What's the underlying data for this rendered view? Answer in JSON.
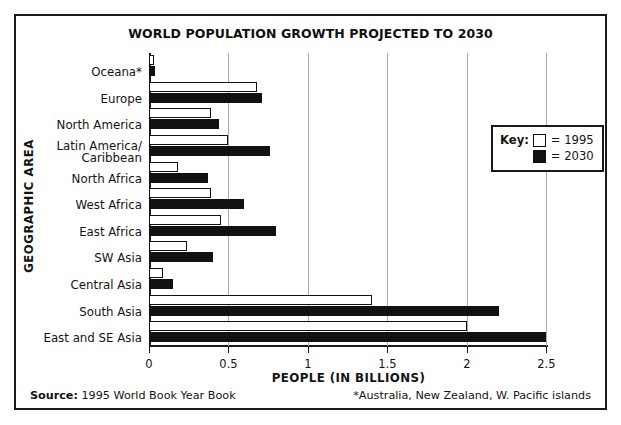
{
  "figure": {
    "title": "WORLD POPULATION GROWTH PROJECTED TO 2030",
    "source_label": "Source:",
    "source_text": " 1995 World Book Year Book",
    "footnote": "*Australia, New Zealand, W. Pacific islands"
  },
  "legend": {
    "key_label": "Key:",
    "entries": [
      {
        "label": "= 1995",
        "style": "open",
        "color": "#ffffff"
      },
      {
        "label": "= 2030",
        "style": "filled",
        "color": "#111111"
      }
    ]
  },
  "chart_data": {
    "type": "bar",
    "orientation": "horizontal",
    "title": "WORLD POPULATION GROWTH PROJECTED TO 2030",
    "xlabel": "PEOPLE (IN BILLIONS)",
    "ylabel": "GEOGRAPHIC AREA",
    "xlim": [
      0,
      2.51
    ],
    "ticks": [
      "0",
      "0.5",
      "1",
      "1.5",
      "2",
      "2.5"
    ],
    "tick_values": [
      0,
      0.5,
      1,
      1.5,
      2,
      2.5
    ],
    "grid": "vertical",
    "legend_position": "right-upper",
    "categories": [
      "Oceana*",
      "Europe",
      "North America",
      "Latin America/\nCaribbean",
      "North Africa",
      "West Africa",
      "East Africa",
      "SW Asia",
      "Central Asia",
      "South Asia",
      "East and SE Asia"
    ],
    "series": [
      {
        "name": "1995",
        "values": [
          0.03,
          0.68,
          0.39,
          0.5,
          0.18,
          0.39,
          0.45,
          0.24,
          0.09,
          1.4,
          2.0
        ]
      },
      {
        "name": "2030",
        "values": [
          0.04,
          0.71,
          0.44,
          0.76,
          0.37,
          0.6,
          0.8,
          0.4,
          0.15,
          2.2,
          2.5
        ]
      }
    ]
  }
}
